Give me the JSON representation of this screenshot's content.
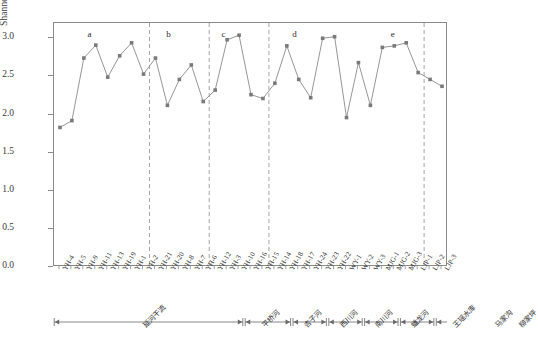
{
  "chart_data": {
    "type": "line",
    "title": "",
    "xlabel": "",
    "ylabel": "Shannon-Wiener多样性指数",
    "ylim": [
      0.0,
      3.2
    ],
    "yticks": [
      "0.0",
      "0.5",
      "1.0",
      "1.5",
      "2.0",
      "2.5",
      "3.0"
    ],
    "ytick_values": [
      0.0,
      0.5,
      1.0,
      1.5,
      2.0,
      2.5,
      3.0
    ],
    "grid": false,
    "legend": "none",
    "marker": "square",
    "series_color": "#8a8a8a",
    "marker_color": "#7a7a7a",
    "categories": [
      "YH-4",
      "YH-5",
      "YH-9",
      "YH-11",
      "YH-13",
      "YH-19",
      "YH-1",
      "YH-2",
      "YH-21",
      "YH-20",
      "YH-8",
      "YH-7",
      "YH-6",
      "YH-12",
      "YH-3",
      "YH-10",
      "YH-16",
      "YH-15",
      "YH-14",
      "YH-18",
      "YH-17",
      "YH-24",
      "YH-23",
      "YH-22",
      "WY-1",
      "WY-2",
      "WY-3",
      "MJG-1",
      "MJG-2",
      "MJG-3",
      "LJP-1",
      "LJP-2",
      "LJP-3"
    ],
    "values": [
      1.83,
      1.92,
      2.74,
      2.91,
      2.49,
      2.77,
      2.94,
      2.53,
      2.74,
      2.12,
      2.46,
      2.65,
      2.17,
      2.32,
      2.98,
      3.04,
      2.26,
      2.21,
      2.41,
      2.9,
      2.46,
      2.22,
      3.0,
      3.02,
      1.96,
      2.68,
      2.12,
      2.88,
      2.9,
      2.94,
      2.55,
      2.46,
      2.37
    ],
    "full_x_labels": [
      "YH-4",
      "YH-5",
      "YH-9",
      "YH-11",
      "YH-13",
      "YH-19",
      "YH-1",
      "YH-2",
      "YH-21",
      "YH-20",
      "YH-8",
      "YH-7",
      "YH-6",
      "YH-12",
      "YH-3",
      "YH-10",
      "YH-16",
      "YH-15",
      "YH-14",
      "YH-18",
      "YH-17",
      "YH-24",
      "YH-23",
      "YH-22",
      "WY-1",
      "WY-2",
      "WY-3",
      "MJG-1",
      "MJG-2",
      "MJG-3",
      "LJP-1",
      "LJP-2",
      "LJP-3"
    ],
    "full_values": [
      1.83,
      1.92,
      2.74,
      2.91,
      2.49,
      2.77,
      2.94,
      2.53,
      2.74,
      2.12,
      2.46,
      2.65,
      2.17,
      2.32,
      2.98,
      3.04,
      2.26,
      2.21,
      2.41,
      2.9,
      2.46,
      2.22,
      3.0,
      3.02,
      1.96,
      2.68,
      2.12,
      2.88,
      2.9,
      2.94,
      2.55,
      2.46,
      2.37
    ],
    "group_dividers_after_index": [
      7,
      12,
      17,
      30
    ],
    "group_letters": [
      {
        "label": "a",
        "x_frac": 0.085
      },
      {
        "label": "b",
        "x_frac": 0.285
      },
      {
        "label": "c",
        "x_frac": 0.425
      },
      {
        "label": "d",
        "x_frac": 0.605
      },
      {
        "label": "e",
        "x_frac": 0.855
      }
    ],
    "region_brackets": [
      {
        "label": "延河干流",
        "start_index": 0,
        "end_index": 15
      },
      {
        "label": "平桥河",
        "start_index": 16,
        "end_index": 19
      },
      {
        "label": "杏子河",
        "start_index": 20,
        "end_index": 22
      },
      {
        "label": "西川河",
        "start_index": 23,
        "end_index": 25
      },
      {
        "label": "南川河",
        "start_index": 26,
        "end_index": 28
      },
      {
        "label": "蟠龙河",
        "start_index": 29,
        "end_index": 31
      },
      {
        "label": "王瑶水库",
        "start_index": 32,
        "end_index": 35
      },
      {
        "label": "马家沟",
        "start_index": 36,
        "end_index": 38
      },
      {
        "label": "柳家坪",
        "start_index": 39,
        "end_index": 39
      }
    ]
  },
  "axis": {
    "y_title": "Shannon-Wiener多样性指数"
  }
}
